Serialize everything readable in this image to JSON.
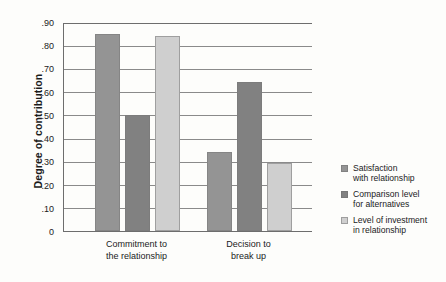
{
  "chart_data": {
    "type": "bar",
    "title": "",
    "xlabel": "",
    "ylabel": "Degree of contribution",
    "ylim": [
      0,
      0.9
    ],
    "grid": true,
    "legend_position": "right",
    "categories": [
      "Commitment to the relationship",
      "Decision to break up"
    ],
    "category_lines": [
      [
        "Commitment to",
        "the relationship"
      ],
      [
        "Decision to",
        "break up"
      ]
    ],
    "ytick_labels": [
      ".90",
      ".80",
      ".70",
      ".60",
      ".50",
      ".40",
      ".30",
      ".20",
      ".10",
      "0"
    ],
    "ytick_values": [
      0.9,
      0.8,
      0.7,
      0.6,
      0.5,
      0.4,
      0.3,
      0.2,
      0.1,
      0
    ],
    "series": [
      {
        "name": "Satisfaction with relationship",
        "name_lines": [
          "Satisfaction",
          "with relationship"
        ],
        "color": "#949494",
        "values": [
          0.85,
          0.34
        ]
      },
      {
        "name": "Comparison level for alternatives",
        "name_lines": [
          "Comparison level",
          "for alternatives"
        ],
        "color": "#818181",
        "values": [
          0.5,
          0.64
        ]
      },
      {
        "name": "Level of investment in relationship",
        "name_lines": [
          "Level of investment",
          "in relationship"
        ],
        "color": "#cfcfcf",
        "values": [
          0.84,
          0.295
        ]
      }
    ]
  }
}
